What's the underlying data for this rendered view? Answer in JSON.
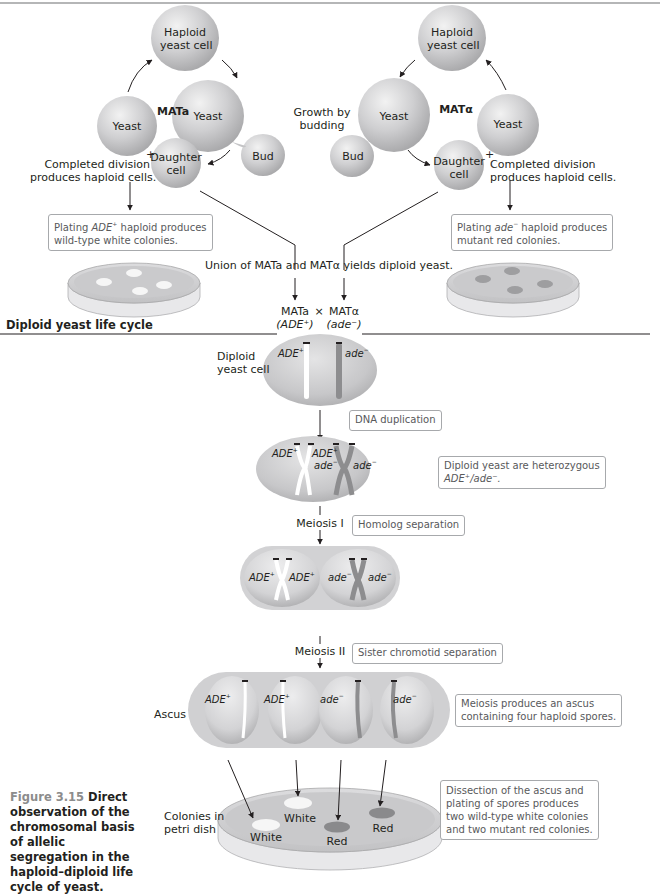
{
  "haploid_cycle": {
    "left": {
      "mating_type": "MATa",
      "cells": {
        "haploid": "Haploid\nyeast cell",
        "haploid_line1": "Haploid",
        "haploid_line2": "yeast cell",
        "yeast_budding": "Yeast",
        "bud": "Bud",
        "daughter_line1": "Daughter",
        "daughter_line2": "cell",
        "yeast": "Yeast"
      },
      "completed_line1": "Completed division",
      "completed_line2": "produces haploid cells.",
      "plus_sign": "+",
      "plating_box_line1_pre": "Plating ",
      "plating_box_allele": "ADE",
      "plating_box_allele_sup": "+",
      "plating_box_line1_post": " haploid produces",
      "plating_box_line2": "wild-type white colonies.",
      "colony_color": "#f4f4f4"
    },
    "right": {
      "mating_type": "MATα",
      "cells": {
        "haploid_line1": "Haploid",
        "haploid_line2": "yeast cell",
        "yeast_budding": "Yeast",
        "bud": "Bud",
        "daughter_line1": "Daughter",
        "daughter_line2": "cell",
        "yeast": "Yeast"
      },
      "completed_line1": "Completed division",
      "completed_line2": "produces haploid cells.",
      "plus_sign": "+",
      "plating_box_line1_pre": "Plating ",
      "plating_box_allele": "ade",
      "plating_box_allele_sup": "−",
      "plating_box_line1_post": " haploid produces",
      "plating_box_line2": "mutant red colonies.",
      "colony_color": "#9e9ea0"
    },
    "growth_label_line1": "Growth by",
    "growth_label_line2": "budding",
    "union_label": "Union of MATa and MATα yields diploid yeast.",
    "cross": {
      "left_type": "MATa",
      "left_allele": "(ADE⁺)",
      "times": "×",
      "right_type": "MATα",
      "right_allele": "(ade⁻)"
    }
  },
  "diploid_cycle": {
    "section_title": "Diploid yeast life cycle",
    "diploid_cell_line1": "Diploid",
    "diploid_cell_line2": "yeast cell",
    "allele_dominant": "ADE",
    "allele_dominant_sup": "+",
    "allele_recessive": "ade",
    "allele_recessive_sup": "−",
    "steps": {
      "dna_duplication": "DNA duplication",
      "heterozygous_line1": "Diploid yeast are heterozygous",
      "heterozygous_line2": "ADE⁺/ade⁻.",
      "meiosis1_label": "Meiosis I",
      "meiosis1_box": "Homolog separation",
      "meiosis2_label": "Meiosis II",
      "meiosis2_box": "Sister chromotid separation",
      "ascus_label": "Ascus",
      "ascus_box_line1": "Meiosis produces an ascus",
      "ascus_box_line2": "containing four haploid spores.",
      "colonies_label_line1": "Colonies in",
      "colonies_label_line2": "petri dish",
      "dissection_line1": "Dissection of the ascus and",
      "dissection_line2": "plating of spores produces",
      "dissection_line3": "two wild-type white colonies",
      "dissection_line4": "and two mutant red colonies."
    },
    "colonies": [
      {
        "label": "White",
        "color": "#f6f6f6"
      },
      {
        "label": "White",
        "color": "#f6f6f6"
      },
      {
        "label": "Red",
        "color": "#8a8a8c"
      },
      {
        "label": "Red",
        "color": "#8a8a8c"
      }
    ]
  },
  "caption": {
    "figure_number": "Figure 3.15",
    "text": " Direct observation of the chromosomal basis of allelic segregation in the haploid–diploid life cycle of yeast."
  },
  "colors": {
    "cell_fill": "#c8c8ca",
    "cell_highlight": "#ececec",
    "box_border": "#a7a9ac",
    "box_text": "#58595b",
    "red_chromosome": "#8d8d8f",
    "white_chromosome": "#ffffff",
    "caption_number": "#8c8c8c"
  }
}
